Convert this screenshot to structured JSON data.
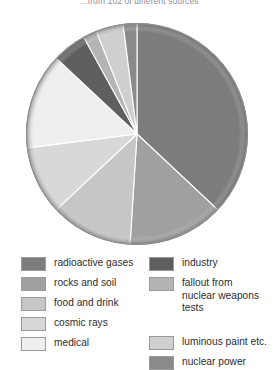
{
  "title": "...from 102 of different sources",
  "chart_data": {
    "type": "pie",
    "title": "...from 102 of different sources",
    "xlabel": "",
    "ylabel": "",
    "legend_position": "bottom",
    "grid": false,
    "categories": [
      "radioactive gases",
      "rocks and soil",
      "food and drink",
      "cosmic rays",
      "medical",
      "industry",
      "fallout from nuclear weapons tests",
      "luminous paint etc.",
      "nuclear power"
    ],
    "values": [
      37,
      14,
      12,
      10,
      14,
      5,
      2,
      4,
      2
    ],
    "colors": [
      "#7c7c7c",
      "#a0a0a0",
      "#c6c6c6",
      "#d8d8d8",
      "#efefef",
      "#5f5f5f",
      "#b4b4b4",
      "#cfcfcf",
      "#8a8a8a"
    ],
    "units": "percent"
  },
  "legend": {
    "left_column": [
      {
        "label": "radioactive gases",
        "color": "#7c7c7c"
      },
      {
        "label": "rocks and soil",
        "color": "#a0a0a0"
      },
      {
        "label": "food and drink",
        "color": "#c6c6c6"
      },
      {
        "label": "cosmic rays",
        "color": "#d8d8d8"
      },
      {
        "label": "medical",
        "color": "#efefef"
      }
    ],
    "right_column": [
      {
        "label": "industry",
        "color": "#5f5f5f"
      },
      {
        "label": "fallout from nuclear weapons tests",
        "color": "#b4b4b4"
      },
      {
        "label": "luminous paint etc.",
        "color": "#cfcfcf"
      },
      {
        "label": "nuclear power",
        "color": "#8a8a8a"
      }
    ]
  }
}
